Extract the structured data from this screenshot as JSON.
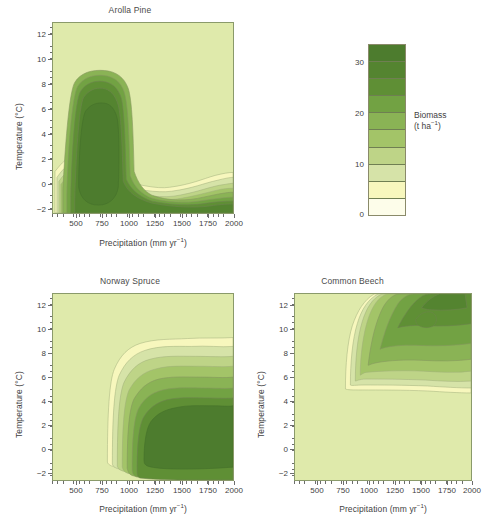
{
  "figure": {
    "background": "#ffffff",
    "plot_background": "#dfeaab",
    "border_color": "#8a9a6a"
  },
  "colorbar": {
    "name": "Biomass",
    "title_line1": "Biomass",
    "title_line2_prefix": "(t ha",
    "title_line2_sup": "−1",
    "title_line2_suffix": ")",
    "units": "t ha−1",
    "min": 0,
    "max": 35,
    "tick_labels": [
      "30",
      "20",
      "10",
      "0"
    ],
    "tick_values": [
      30,
      20,
      10,
      0
    ],
    "band_edges": [
      35,
      31.5,
      28,
      24.5,
      21,
      17.5,
      14,
      10.5,
      7,
      3.5,
      0
    ],
    "bands_top_to_bottom": [
      {
        "range": "31.5-35",
        "color": "#4d7c2e"
      },
      {
        "range": "28-31.5",
        "color": "#548430"
      },
      {
        "range": "24.5-28",
        "color": "#5f8f35"
      },
      {
        "range": "21-24.5",
        "color": "#72a243"
      },
      {
        "range": "17.5-21",
        "color": "#8ab355"
      },
      {
        "range": "14-17.5",
        "color": "#a3c468"
      },
      {
        "range": "10.5-14",
        "color": "#bed487"
      },
      {
        "range": "7-10.5",
        "color": "#d6e3a8"
      },
      {
        "range": "3.5-7",
        "color": "#f7f7bd"
      },
      {
        "range": "0-3.5",
        "color": "#fdfdea"
      }
    ]
  },
  "axes": {
    "x": {
      "label_prefix": "Precipitation (mm yr",
      "label_sup": "−1",
      "label_suffix": ")",
      "label_full": "Precipitation (mm yr−1)",
      "min": 350,
      "max": 2050,
      "tick_labels": [
        "500",
        "750",
        "1000",
        "1250",
        "1500",
        "1750",
        "2000"
      ],
      "tick_values": [
        500,
        750,
        1000,
        1250,
        1500,
        1750,
        2000
      ],
      "minor_step": 50
    },
    "y": {
      "label_prefix": "Temperature (",
      "label_degree": "°",
      "label_suffix": "C)",
      "label_full": "Temperature (°C)",
      "min": -2,
      "max": 13.4,
      "tick_labels": [
        "−2",
        "0",
        "2",
        "4",
        "6",
        "8",
        "10",
        "12"
      ],
      "tick_values": [
        -2,
        0,
        2,
        4,
        6,
        8,
        10,
        12
      ],
      "minor_step": 0.5
    }
  },
  "panels": [
    {
      "id": "arolla-pine",
      "title": "Arolla Pine",
      "description": "Biomass peaks at low precipitation (450-800 mm) and low temperature (0-4 C), with a faint low-biomass ridge extending along 0-1.5 C to 2000 mm."
    },
    {
      "id": "norway-spruce",
      "title": "Norway Spruce",
      "description": "Biomass rises sharply above 800 mm precipitation, with a broad high-biomass plateau from 1000-2000 mm at 0-5 C."
    },
    {
      "id": "common-beech",
      "title": "Common Beech",
      "description": "Biomass confined to warm conditions above 5.5 C and precipitation above 750 mm, strongest at 9-13 C and 1100-2000 mm."
    }
  ],
  "chart_data": {
    "type": "heatmap",
    "subtype": "filled-contour",
    "title": "",
    "xlabel": "Precipitation (mm yr−1)",
    "ylabel": "Temperature (°C)",
    "zlabel": "Biomass (t ha−1)",
    "xlim": [
      350,
      2050
    ],
    "ylim": [
      -2,
      13.4
    ],
    "zlim": [
      0,
      35
    ],
    "contour_levels": [
      0,
      3.5,
      7,
      10.5,
      14,
      17.5,
      21,
      24.5,
      28,
      31.5,
      35
    ],
    "grid": false,
    "legend": "colorbar-right-of-top-panel",
    "colormap": [
      "#fdfdea",
      "#f7f7bd",
      "#d6e3a8",
      "#bed487",
      "#a3c468",
      "#8ab355",
      "#72a243",
      "#5f8f35",
      "#548430",
      "#4d7c2e"
    ],
    "panels": [
      {
        "name": "Arolla Pine",
        "peak_biomass": 35,
        "peak_location": {
          "precipitation": 620,
          "temperature": 2.0
        },
        "regions": [
          {
            "level": 3.5,
            "precip_range": [
              380,
              2050
            ],
            "temp_range": [
              -1.6,
              4.7
            ]
          },
          {
            "level": 10.5,
            "precip_range": [
              400,
              900
            ],
            "temp_range": [
              -1.3,
              4.4
            ]
          },
          {
            "level": 21,
            "precip_range": [
              430,
              840
            ],
            "temp_range": [
              -1.0,
              4.0
            ]
          },
          {
            "level": 31.5,
            "precip_range": [
              470,
              790
            ],
            "temp_range": [
              -0.6,
              3.3
            ]
          }
        ]
      },
      {
        "name": "Norway Spruce",
        "peak_biomass": 35,
        "peak_location": {
          "precipitation": 1500,
          "temperature": 3.0
        },
        "regions": [
          {
            "level": 3.5,
            "precip_range": [
              760,
              2050
            ],
            "temp_range": [
              -0.7,
              9.0
            ]
          },
          {
            "level": 10.5,
            "precip_range": [
              830,
              2050
            ],
            "temp_range": [
              -0.3,
              7.6
            ]
          },
          {
            "level": 21,
            "precip_range": [
              880,
              2050
            ],
            "temp_range": [
              0.1,
              6.2
            ]
          },
          {
            "level": 31.5,
            "precip_range": [
              960,
              2050
            ],
            "temp_range": [
              0.6,
              4.9
            ]
          }
        ]
      },
      {
        "name": "Common Beech",
        "peak_biomass": 28,
        "peak_location": {
          "precipitation": 1500,
          "temperature": 11.5
        },
        "regions": [
          {
            "level": 3.5,
            "precip_range": [
              760,
              2050
            ],
            "temp_range": [
              5.4,
              13.4
            ]
          },
          {
            "level": 10.5,
            "precip_range": [
              830,
              2050
            ],
            "temp_range": [
              6.4,
              13.4
            ]
          },
          {
            "level": 17.5,
            "precip_range": [
              900,
              2050
            ],
            "temp_range": [
              7.6,
              13.4
            ]
          },
          {
            "level": 24.5,
            "precip_range": [
              1050,
              2050
            ],
            "temp_range": [
              9.2,
              13.4
            ]
          }
        ]
      }
    ]
  }
}
